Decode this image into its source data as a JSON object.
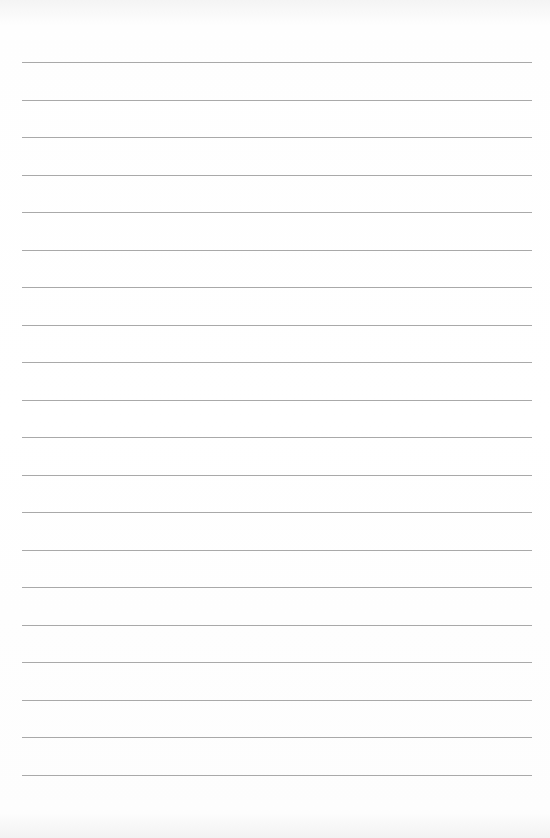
{
  "page": {
    "type": "lined-paper",
    "background_color": "#fdfdfd",
    "rule_color": "#9a9a9a",
    "line_count": 20,
    "first_line_y": 62,
    "line_spacing": 37.5,
    "line_left": 22,
    "line_width": 510,
    "text": ""
  }
}
